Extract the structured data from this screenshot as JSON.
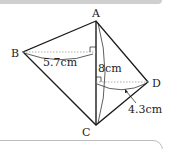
{
  "diagram": {
    "vertices": [
      {
        "label": "A",
        "x": 96,
        "y": 21
      },
      {
        "label": "B",
        "x": 23,
        "y": 52
      },
      {
        "label": "C",
        "x": 96,
        "y": 125
      },
      {
        "label": "D",
        "x": 148,
        "y": 82
      }
    ],
    "measurements": {
      "b_to_ac": "5.7cm",
      "ac_length": "8cm",
      "d_to_ac": "4.3cm"
    },
    "colors": {
      "line": "#1a1a1a",
      "dotted": "#9a9a9a",
      "top_band": "#cfcfcf",
      "box_border": "#bdbdbd"
    }
  }
}
